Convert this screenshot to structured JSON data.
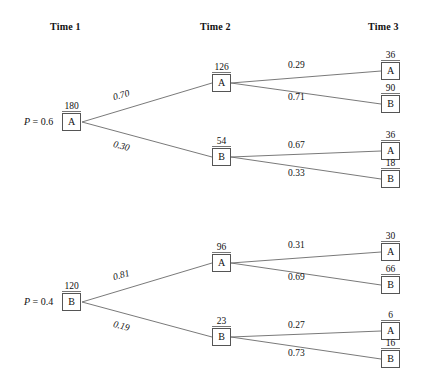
{
  "figure": {
    "type": "probability-tree-diagram",
    "columns": [
      {
        "id": "t1",
        "label": "Time 1"
      },
      {
        "id": "t2",
        "label": "Time 2"
      },
      {
        "id": "t3",
        "label": "Time 3"
      }
    ]
  },
  "trees": [
    {
      "id": "tree-a",
      "root": {
        "prob_label": "P = 0.6",
        "prob_symbol": "P",
        "prob_text": " = 0.6",
        "state": "A",
        "count": "180"
      },
      "stage1": [
        {
          "prob": "0.70",
          "state": "A",
          "count": "126"
        },
        {
          "prob": "0.30",
          "state": "B",
          "count": "54"
        }
      ],
      "stage2": [
        {
          "from": "A",
          "prob": "0.29",
          "state": "A",
          "count": "36"
        },
        {
          "from": "A",
          "prob": "0.71",
          "state": "B",
          "count": "90"
        },
        {
          "from": "B",
          "prob": "0.67",
          "state": "A",
          "count": "36"
        },
        {
          "from": "B",
          "prob": "0.33",
          "state": "B",
          "count": "18"
        }
      ]
    },
    {
      "id": "tree-b",
      "root": {
        "prob_label": "P = 0.4",
        "prob_symbol": "P",
        "prob_text": " = 0.4",
        "state": "B",
        "count": "120"
      },
      "stage1": [
        {
          "prob": "0.81",
          "state": "A",
          "count": "96"
        },
        {
          "prob": "0.19",
          "state": "B",
          "count": "23"
        }
      ],
      "stage2": [
        {
          "from": "A",
          "prob": "0.31",
          "state": "A",
          "count": "30"
        },
        {
          "from": "A",
          "prob": "0.69",
          "state": "B",
          "count": "66"
        },
        {
          "from": "B",
          "prob": "0.27",
          "state": "A",
          "count": "6"
        },
        {
          "from": "B",
          "prob": "0.73",
          "state": "B",
          "count": "16"
        }
      ]
    }
  ],
  "colors": {
    "ink": "#1a1a1a",
    "line": "#6a6a6a",
    "box_border": "#555555",
    "background": "#ffffff"
  }
}
